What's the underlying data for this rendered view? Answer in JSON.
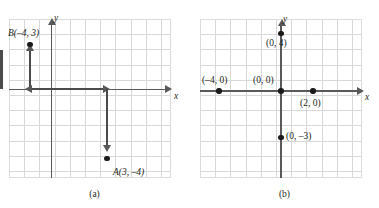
{
  "figure": {
    "panels": [
      {
        "id": "a",
        "caption": "(a)",
        "axis_labels": {
          "x": "x",
          "y": "y"
        },
        "grid": {
          "columns": 11,
          "rows": 10,
          "cell_px": 15.2,
          "show": true
        },
        "axes": {
          "x_at_y": 0,
          "y_at_x": 0,
          "arrowheads": [
            "x-right",
            "y-up"
          ]
        },
        "points": [
          {
            "name": "B",
            "label": "B(–4, 3)",
            "x": -4,
            "y": 3
          },
          {
            "name": "A",
            "label": "A(3, –4)",
            "x": 3,
            "y": -4
          }
        ],
        "path": {
          "description": "Arrow path from B down to x-axis, along x-axis to x=3, then down to A",
          "segments": [
            {
              "from": [
                -4,
                3
              ],
              "to": [
                -4,
                0
              ],
              "arrow_at": "from"
            },
            {
              "from": [
                -4,
                0
              ],
              "to": [
                3,
                0
              ],
              "arrow_at": "both"
            },
            {
              "from": [
                3,
                0
              ],
              "to": [
                3,
                -4
              ],
              "arrow_at": "to"
            }
          ]
        }
      },
      {
        "id": "b",
        "caption": "(b)",
        "axis_labels": {
          "x": "x",
          "y": "y"
        },
        "grid": {
          "columns": 11,
          "rows": 10,
          "cell_px": 15.2,
          "show": true
        },
        "axes": {
          "x_at_y": 0,
          "y_at_x": 0,
          "arrowheads": [
            "x-right",
            "y-up"
          ]
        },
        "points": [
          {
            "label": "(–4, 0)",
            "x": -4,
            "y": 0
          },
          {
            "label": "(0, 0)",
            "x": 0,
            "y": 0
          },
          {
            "label": "(2, 0)",
            "x": 2,
            "y": 0
          },
          {
            "label": "(0, 4)",
            "x": 0,
            "y": 4
          },
          {
            "label": "(0, –3)",
            "x": 0,
            "y": -3
          }
        ]
      }
    ]
  },
  "colors": {
    "grid_line": "#d8d8d8",
    "axis": "#59595b",
    "path": "#4b4b4d",
    "point": "#1a1a1a",
    "text": "#231f20",
    "background": "#ffffff"
  }
}
